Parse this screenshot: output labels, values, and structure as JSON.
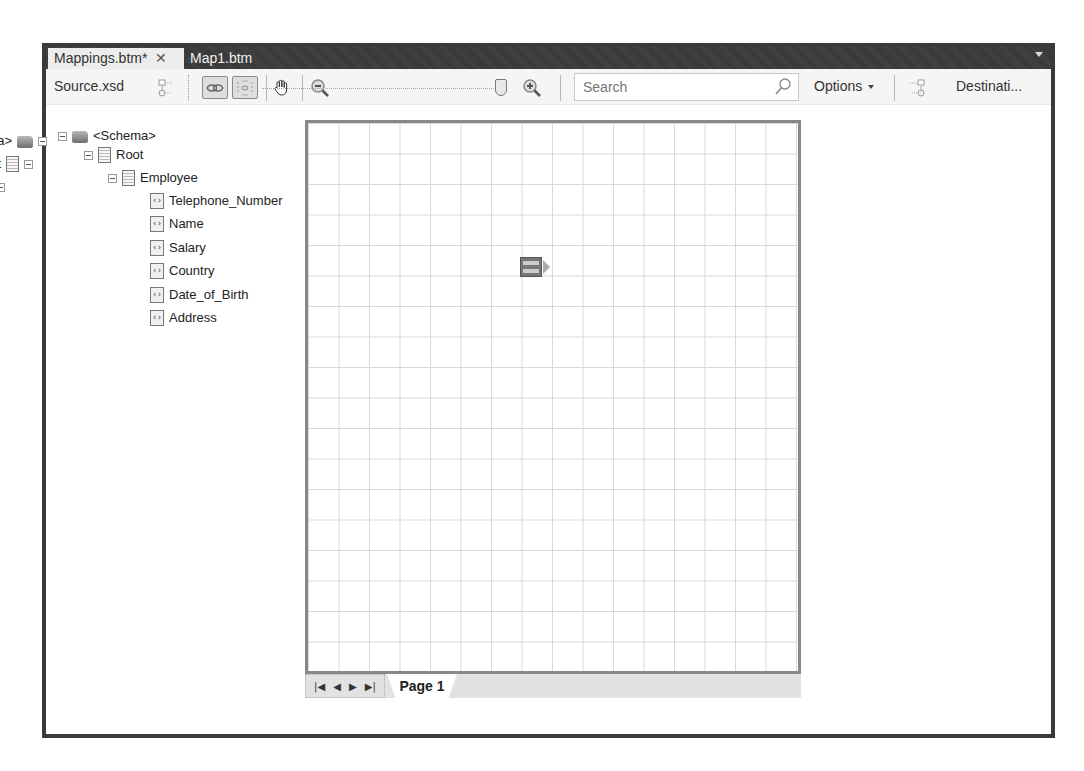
{
  "tabs": [
    {
      "label": "Mappings.btm*",
      "active": true,
      "close_glyph": "✕"
    },
    {
      "label": "Map1.btm",
      "active": false
    }
  ],
  "toolbar": {
    "source_label": "Source.xsd",
    "destination_label": "Destinati...",
    "search": {
      "placeholder": "Search",
      "value": ""
    },
    "options_label": "Options",
    "zoom_level_percent": 100,
    "icons": [
      "source-schema-icon",
      "link-icon",
      "link-relevance-icon",
      "hand-pan-icon",
      "zoom-out-icon",
      "zoom-in-icon",
      "search-icon",
      "destination-schema-icon"
    ]
  },
  "source_tree": {
    "schema": "<Schema>",
    "root": "Root",
    "record": "Employee",
    "fields": [
      "Telephone_Number",
      "Name",
      "Salary",
      "Country",
      "Date_of_Birth",
      "Address"
    ]
  },
  "destination_tree": {
    "schema": "<Schema>",
    "root": "Root",
    "record": "Person",
    "fields": [
      "Name",
      "Address",
      "Other"
    ]
  },
  "grid": {
    "page_tab": "Page 1",
    "nav": [
      "|◀",
      "◀",
      "▶",
      "▶|"
    ]
  }
}
